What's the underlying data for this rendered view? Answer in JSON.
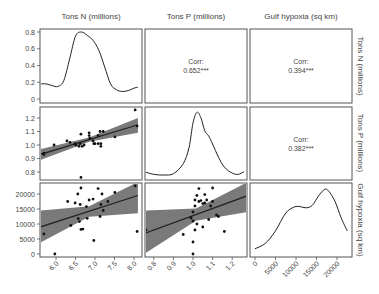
{
  "chart_data": {
    "type": "scatter",
    "title": "",
    "layout": "pairs-plot 3x3 (ggpairs style)",
    "variables": [
      "Tons N (millions)",
      "Tons P (millions)",
      "Gulf hypoxia (sq km)"
    ],
    "column_labels": [
      "Tons N (millions)",
      "Tons P (millions)",
      "Gulf hypoxia (sq km)"
    ],
    "row_labels": [
      "Tons N (millions)",
      "Tons P (millions)",
      "Gulf hypoxia (sq km)"
    ],
    "axes": {
      "N": {
        "range": [
          5.6,
          8.2
        ],
        "ticks": [
          6.0,
          6.5,
          7.0,
          7.5,
          8.0
        ],
        "tick_labels": [
          "6.0",
          "6.5",
          "7.0",
          "7.5",
          "8.0"
        ]
      },
      "P": {
        "range": [
          0.75,
          1.28
        ],
        "ticks": [
          0.8,
          0.9,
          1.0,
          1.1,
          1.2
        ],
        "tick_labels": [
          "0.8",
          "0.9",
          "1.0",
          "1.1",
          "1.2"
        ]
      },
      "H": {
        "range": [
          -500,
          24000
        ],
        "ticks": [
          0,
          5000,
          10000,
          15000,
          20000
        ],
        "tick_labels": [
          "0",
          "5000",
          "10000",
          "15000",
          "20000"
        ]
      },
      "density_N": {
        "range": [
          0,
          0.85
        ],
        "ticks": [
          0,
          0.2,
          0.4,
          0.6,
          0.8
        ],
        "tick_labels": [
          "0",
          "0.2",
          "0.4",
          "0.6",
          "0.8"
        ]
      }
    },
    "correlations": [
      {
        "row": 0,
        "col": 1,
        "label": "Corr:",
        "value": "0.652***"
      },
      {
        "row": 0,
        "col": 2,
        "label": "Corr:",
        "value": "0.394***"
      },
      {
        "row": 1,
        "col": 2,
        "label": "Corr:",
        "value": "0.382***"
      }
    ],
    "densities": {
      "N": {
        "x": [
          5.6,
          5.75,
          5.9,
          6.05,
          6.2,
          6.35,
          6.5,
          6.65,
          6.8,
          6.95,
          7.1,
          7.25,
          7.4,
          7.55,
          7.7,
          7.85,
          8.0,
          8.1
        ],
        "y": [
          0.18,
          0.18,
          0.16,
          0.15,
          0.22,
          0.48,
          0.75,
          0.8,
          0.76,
          0.7,
          0.58,
          0.38,
          0.18,
          0.11,
          0.09,
          0.1,
          0.13,
          0.14
        ]
      },
      "P": {
        "x": [
          0.75,
          0.8,
          0.85,
          0.9,
          0.95,
          0.98,
          1.0,
          1.02,
          1.04,
          1.06,
          1.08,
          1.1,
          1.13,
          1.16,
          1.2,
          1.23,
          1.26
        ],
        "y": [
          0.08,
          0.04,
          0.03,
          0.05,
          0.2,
          0.45,
          0.82,
          0.98,
          0.9,
          0.7,
          0.62,
          0.5,
          0.3,
          0.15,
          0.06,
          0.04,
          0.08
        ]
      },
      "H": {
        "x": [
          0,
          2500,
          5000,
          7500,
          10000,
          12500,
          14000,
          15500,
          17000,
          18000,
          19500,
          21000,
          22500
        ],
        "y": [
          0.08,
          0.16,
          0.35,
          0.62,
          0.72,
          0.7,
          0.74,
          0.88,
          0.98,
          0.95,
          0.8,
          0.55,
          0.35
        ]
      }
    },
    "scatter": {
      "N_vs_P": {
        "x_var": "Tons N (millions)",
        "y_var": "Tons P (millions)",
        "points": [
          [
            5.69,
            0.94
          ],
          [
            5.69,
            0.93
          ],
          [
            5.95,
            1.0
          ],
          [
            6.28,
            1.03
          ],
          [
            6.36,
            1.02
          ],
          [
            6.49,
            1.01
          ],
          [
            6.51,
            1.0
          ],
          [
            6.59,
            0.99
          ],
          [
            6.62,
            1.01
          ],
          [
            6.64,
            1.08
          ],
          [
            6.67,
            0.99
          ],
          [
            6.72,
            1.0
          ],
          [
            6.85,
            1.09
          ],
          [
            6.85,
            1.07
          ],
          [
            6.87,
            1.05
          ],
          [
            6.95,
            1.03
          ],
          [
            6.97,
            1.01
          ],
          [
            7.0,
            1.01
          ],
          [
            7.08,
            1.07
          ],
          [
            7.08,
            1.01
          ],
          [
            7.13,
            1.1
          ],
          [
            7.15,
            1.01
          ],
          [
            7.15,
            0.99
          ],
          [
            7.21,
            1.1
          ],
          [
            6.64,
            0.76
          ],
          [
            7.51,
            1.06
          ],
          [
            8.03,
            1.26
          ],
          [
            8.08,
            1.14
          ]
        ],
        "fit": {
          "x": [
            5.6,
            8.1
          ],
          "y": [
            0.93,
            1.15
          ]
        },
        "ci_lower": [
          0.89,
          1.09
        ],
        "ci_upper": [
          0.97,
          1.2
        ]
      },
      "N_vs_H": {
        "x_var": "Tons N (millions)",
        "y_var": "Gulf hypoxia (sq km)",
        "points": [
          [
            5.69,
            6700
          ],
          [
            5.97,
            0
          ],
          [
            6.3,
            17500
          ],
          [
            6.38,
            9500
          ],
          [
            6.49,
            17000
          ],
          [
            6.56,
            20000
          ],
          [
            6.57,
            11800
          ],
          [
            6.6,
            10800
          ],
          [
            6.62,
            16500
          ],
          [
            6.64,
            22000
          ],
          [
            6.64,
            8200
          ],
          [
            6.69,
            8300
          ],
          [
            6.78,
            15800
          ],
          [
            6.8,
            11900
          ],
          [
            6.85,
            18000
          ],
          [
            6.95,
            18300
          ],
          [
            6.97,
            4500
          ],
          [
            7.08,
            21800
          ],
          [
            7.13,
            12500
          ],
          [
            7.15,
            16500
          ],
          [
            7.18,
            20000
          ],
          [
            7.21,
            14500
          ],
          [
            7.33,
            17500
          ],
          [
            7.51,
            20500
          ],
          [
            8.03,
            22700
          ],
          [
            8.08,
            7500
          ]
        ],
        "fit": {
          "x": [
            5.6,
            8.1
          ],
          "y": [
            9000,
            19500
          ]
        },
        "ci_lower": [
          3800,
          13600
        ],
        "ci_upper": [
          14500,
          24000
        ]
      },
      "P_vs_H": {
        "x_var": "Tons P (millions)",
        "y_var": "Gulf hypoxia (sq km)",
        "points": [
          [
            0.76,
            8000
          ],
          [
            0.95,
            6500
          ],
          [
            0.99,
            12000
          ],
          [
            1.0,
            11000
          ],
          [
            1.0,
            14000
          ],
          [
            1.01,
            16000
          ],
          [
            1.01,
            18000
          ],
          [
            1.02,
            19500
          ],
          [
            1.02,
            10000
          ],
          [
            1.01,
            8000
          ],
          [
            1.03,
            17500
          ],
          [
            1.03,
            21800
          ],
          [
            1.04,
            17800
          ],
          [
            1.05,
            16800
          ],
          [
            1.05,
            9000
          ],
          [
            1.06,
            17000
          ],
          [
            1.06,
            19800
          ],
          [
            1.07,
            18000
          ],
          [
            1.08,
            11500
          ],
          [
            1.09,
            16000
          ],
          [
            1.1,
            17500
          ],
          [
            1.1,
            22000
          ],
          [
            1.12,
            13000
          ],
          [
            1.13,
            12500
          ],
          [
            1.16,
            7500
          ],
          [
            1.0,
            4000
          ],
          [
            1.0,
            0
          ],
          [
            1.28,
            22700
          ]
        ],
        "fit": {
          "x": [
            0.75,
            1.28
          ],
          "y": [
            6800,
            19500
          ]
        },
        "ci_lower": [
          0,
          14000
        ],
        "ci_upper": [
          14500,
          24000
        ]
      }
    },
    "colors": {
      "line": "#222222",
      "ci_band": "#7a7a7a",
      "point": "#111111",
      "panel_border": "#555555",
      "text": "#444444"
    },
    "grid": false,
    "legend": "none"
  }
}
